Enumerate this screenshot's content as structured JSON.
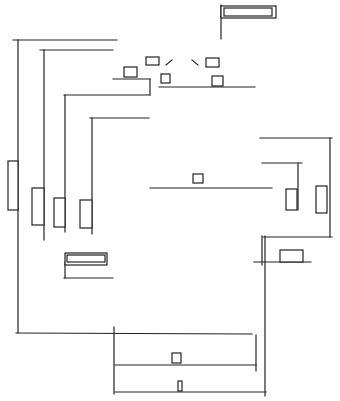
{
  "diagram": {
    "type": "line-schematic",
    "background": "#ffffff",
    "stroke": "#222222",
    "lines": [
      [
        13,
        40,
        117,
        40
      ],
      [
        18,
        40,
        18,
        333
      ],
      [
        40,
        50,
        113,
        50
      ],
      [
        44,
        50,
        44,
        240
      ],
      [
        64,
        95,
        150,
        95
      ],
      [
        65,
        95,
        65,
        232
      ],
      [
        90,
        118,
        149,
        118
      ],
      [
        92,
        118,
        92,
        234
      ],
      [
        113,
        79,
        150,
        79
      ],
      [
        150,
        79,
        150,
        95
      ],
      [
        159,
        87,
        255,
        87
      ],
      [
        150,
        188,
        272,
        188
      ],
      [
        221,
        5,
        221,
        39
      ],
      [
        260,
        138,
        332,
        138
      ],
      [
        330,
        138,
        330,
        237
      ],
      [
        262,
        163,
        302,
        163
      ],
      [
        298,
        163,
        298,
        210
      ],
      [
        263,
        237,
        332,
        237
      ],
      [
        262,
        236,
        262,
        265
      ],
      [
        265,
        236,
        265,
        396
      ],
      [
        254,
        262,
        311,
        262
      ],
      [
        16,
        333,
        252,
        334
      ],
      [
        114,
        327,
        114,
        394
      ],
      [
        115,
        365,
        256,
        365
      ],
      [
        256,
        335,
        256,
        371
      ],
      [
        115,
        392,
        266,
        392
      ],
      [
        64,
        278,
        113,
        278
      ],
      [
        65,
        262,
        65,
        278
      ],
      [
        166,
        65,
        172,
        60
      ],
      [
        192,
        60,
        198,
        65
      ]
    ],
    "rects": [
      {
        "x": 221,
        "y": 6,
        "w": 55,
        "h": 12,
        "name": "top-right-box-outer"
      },
      {
        "x": 224,
        "y": 8,
        "w": 48,
        "h": 8,
        "name": "top-right-box-inner"
      },
      {
        "x": 124,
        "y": 67,
        "w": 13,
        "h": 10,
        "name": "component-box"
      },
      {
        "x": 146,
        "y": 57,
        "w": 13,
        "h": 8,
        "name": "component-box"
      },
      {
        "x": 161,
        "y": 74,
        "w": 9,
        "h": 9,
        "name": "component-box"
      },
      {
        "x": 206,
        "y": 58,
        "w": 13,
        "h": 9,
        "name": "component-box"
      },
      {
        "x": 212,
        "y": 76,
        "w": 11,
        "h": 10,
        "name": "component-box"
      },
      {
        "x": 8,
        "y": 161,
        "w": 10,
        "h": 49,
        "name": "vertical-component"
      },
      {
        "x": 32,
        "y": 188,
        "w": 12,
        "h": 37,
        "name": "vertical-component"
      },
      {
        "x": 54,
        "y": 198,
        "w": 11,
        "h": 29,
        "name": "vertical-component"
      },
      {
        "x": 80,
        "y": 200,
        "w": 12,
        "h": 28,
        "name": "vertical-component"
      },
      {
        "x": 193,
        "y": 174,
        "w": 10,
        "h": 9,
        "name": "component-box"
      },
      {
        "x": 286,
        "y": 189,
        "w": 11,
        "h": 21,
        "name": "vertical-component"
      },
      {
        "x": 316,
        "y": 186,
        "w": 11,
        "h": 27,
        "name": "vertical-component"
      },
      {
        "x": 280,
        "y": 250,
        "w": 23,
        "h": 12,
        "name": "component-box"
      },
      {
        "x": 65,
        "y": 253,
        "w": 42,
        "h": 12,
        "name": "left-box-outer"
      },
      {
        "x": 67,
        "y": 255,
        "w": 38,
        "h": 7,
        "name": "left-box-inner"
      },
      {
        "x": 172,
        "y": 353,
        "w": 9,
        "h": 10,
        "name": "component-box"
      },
      {
        "x": 178,
        "y": 381,
        "w": 4,
        "h": 10,
        "name": "small-component"
      }
    ]
  }
}
